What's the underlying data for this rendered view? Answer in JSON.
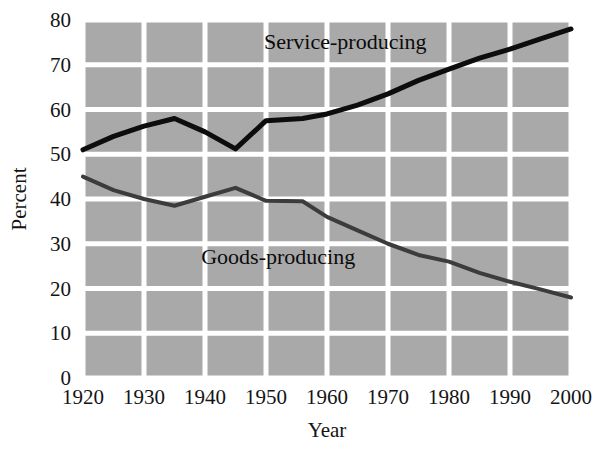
{
  "chart_data": {
    "type": "line",
    "title": "",
    "xlabel": "Year",
    "ylabel": "Percent",
    "xlim": [
      1920,
      2000
    ],
    "ylim": [
      0,
      80
    ],
    "xticks": [
      1920,
      1930,
      1940,
      1950,
      1960,
      1970,
      1980,
      1990,
      2000
    ],
    "yticks": [
      0,
      10,
      20,
      30,
      40,
      50,
      60,
      70,
      80
    ],
    "grid": true,
    "legend_position": "inline-annotation",
    "plot_background": "#a9a9a9",
    "gridline_color": "#ffffff",
    "series": [
      {
        "name": "Service-producing",
        "color": "#0d0d0d",
        "line_width": 5,
        "label_text": "Service-producing",
        "x": [
          1920,
          1925,
          1930,
          1935,
          1940,
          1945,
          1950,
          1956,
          1960,
          1965,
          1970,
          1975,
          1980,
          1985,
          1990,
          1995,
          2000
        ],
        "values": [
          51.0,
          54.0,
          56.3,
          58.0,
          55.0,
          51.2,
          57.5,
          58.0,
          59.0,
          61.0,
          63.5,
          66.5,
          69.0,
          71.5,
          73.5,
          75.8,
          78.0
        ]
      },
      {
        "name": "Goods-producing",
        "color": "#3c3c3c",
        "line_width": 4,
        "label_text": "Goods-producing",
        "x": [
          1920,
          1925,
          1930,
          1935,
          1940,
          1945,
          1950,
          1956,
          1960,
          1965,
          1970,
          1975,
          1980,
          1985,
          1990,
          1995,
          2000
        ],
        "values": [
          45.0,
          42.0,
          40.0,
          38.5,
          40.5,
          42.5,
          39.6,
          39.5,
          36.0,
          33.0,
          30.0,
          27.5,
          26.0,
          23.5,
          21.5,
          19.8,
          18.0
        ]
      }
    ],
    "annotations": [
      {
        "text": "Service-producing",
        "x": 1963,
        "y": 73.5
      },
      {
        "text": "Goods-producing",
        "x": 1952,
        "y": 25.5
      }
    ]
  }
}
